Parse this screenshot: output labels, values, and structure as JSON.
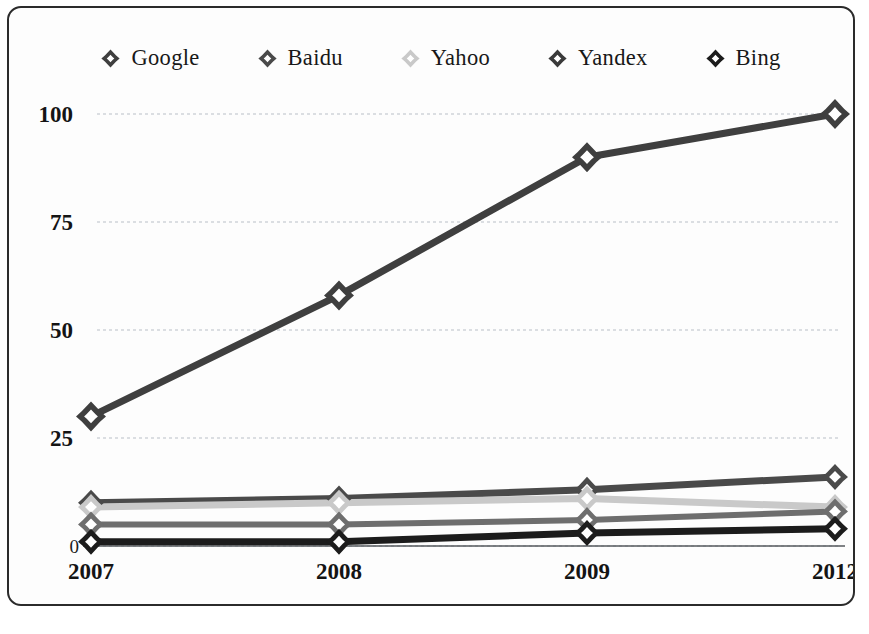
{
  "legend": {
    "position": "top-center",
    "items": [
      {
        "label": "Google",
        "color": "#3f3f3f",
        "marker": "diamond-ring-icon"
      },
      {
        "label": "Baidu",
        "color": "#4a4a4a",
        "marker": "diamond-ring-icon"
      },
      {
        "label": "Yahoo",
        "color": "#c9c9c9",
        "marker": "diamond-ring-icon"
      },
      {
        "label": "Yandex",
        "color": "#3a3a3a",
        "marker": "diamond-ring-icon"
      },
      {
        "label": "Bing",
        "color": "#1c1c1c",
        "marker": "diamond-ring-icon"
      }
    ]
  },
  "axes": {
    "y_ticks": [
      "100",
      "75",
      "50",
      "25",
      "0"
    ],
    "x_ticks": [
      "2007",
      "2008",
      "2009",
      "2012"
    ]
  },
  "chart_data": {
    "type": "line",
    "title": "",
    "subtitle": "",
    "xlabel": "",
    "ylabel": "",
    "categories": [
      "2007",
      "2008",
      "2009",
      "2012"
    ],
    "x": [
      2007,
      2008,
      2009,
      2012
    ],
    "ylim": [
      0,
      100
    ],
    "yticks": [
      0,
      25,
      50,
      75,
      100
    ],
    "grid": true,
    "legend_position": "top",
    "series": [
      {
        "name": "Google",
        "color": "#3f3f3f",
        "width": 7,
        "marker": "diamond-ring",
        "values": [
          30,
          58,
          90,
          100
        ]
      },
      {
        "name": "Baidu",
        "color": "#4a4a4a",
        "width": 7,
        "marker": "diamond-ring",
        "values": [
          10,
          11,
          13,
          16
        ]
      },
      {
        "name": "Yahoo",
        "color": "#c9c9c9",
        "width": 7,
        "marker": "diamond-ring",
        "values": [
          9,
          10,
          11,
          9
        ]
      },
      {
        "name": "Yandex",
        "color": "#6e6e6e",
        "width": 6,
        "marker": "diamond-ring",
        "values": [
          5,
          5,
          6,
          8
        ]
      },
      {
        "name": "Bing",
        "color": "#1c1c1c",
        "width": 7,
        "marker": "diamond-ring",
        "values": [
          1,
          1,
          3,
          4
        ]
      }
    ]
  },
  "colors": {
    "frame": "#2b2b2b",
    "background": "#fdfdfd",
    "gridline": "#b9bfc7",
    "axis": "#55585c",
    "text": "#141414"
  }
}
